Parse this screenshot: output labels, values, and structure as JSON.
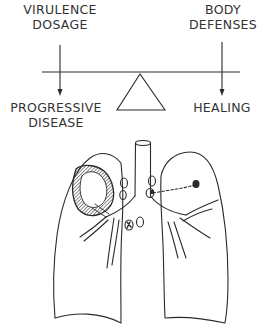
{
  "diagram": {
    "balance": {
      "left_force": {
        "lines": [
          "VIRULENCE",
          "DOSAGE"
        ]
      },
      "right_force": {
        "lines": [
          "BODY",
          "DEFENSES"
        ]
      },
      "left_outcome": {
        "lines": [
          "PROGRESSIVE",
          "DISEASE"
        ]
      },
      "right_outcome": {
        "lines": [
          "HEALING"
        ]
      }
    },
    "lungs": {
      "features": [
        "trachea",
        "bronchi",
        "cavitary-lesion-right-upper-lobe",
        "hilar-lymph-nodes",
        "primary-focus-left-lung",
        "lymphatic-connection-dashed"
      ]
    },
    "colors": {
      "ink": "#2a2a2a",
      "background": "#ffffff"
    }
  }
}
